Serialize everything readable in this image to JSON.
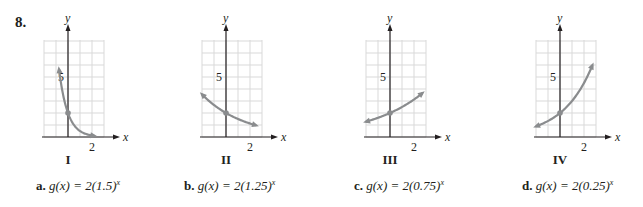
{
  "problem_number": "8.",
  "graphs": [
    {
      "label": "I",
      "base": 0.25,
      "origin_x": 68,
      "grid_left": 44,
      "grid_right": 104
    },
    {
      "label": "II",
      "base": 0.75,
      "origin_x": 226,
      "grid_left": 202,
      "grid_right": 262
    },
    {
      "label": "III",
      "base": 1.25,
      "origin_x": 390,
      "grid_left": 366,
      "grid_right": 426
    },
    {
      "label": "IV",
      "base": 1.5,
      "origin_x": 560,
      "grid_left": 536,
      "grid_right": 596
    }
  ],
  "axis": {
    "x_label": "x",
    "y_label": "y",
    "x_tick": "2",
    "y_tick": "5"
  },
  "options": [
    {
      "letter": "a.",
      "expr_prefix": "g(x) = 2(1.5)",
      "exp": "x"
    },
    {
      "letter": "b.",
      "expr_prefix": "g(x) = 2(1.25)",
      "exp": "x"
    },
    {
      "letter": "c.",
      "expr_prefix": "g(x) = 2(0.75)",
      "exp": "x"
    },
    {
      "letter": "d.",
      "expr_prefix": "g(x) = 2(0.25)",
      "exp": "x"
    }
  ],
  "chart_data": [
    {
      "type": "line",
      "title": "I",
      "function": "g(x)=2(0.25)^x",
      "x_range": [
        -0.75,
        2.2
      ],
      "point": [
        0,
        2
      ]
    },
    {
      "type": "line",
      "title": "II",
      "function": "g(x)=2(0.75)^x",
      "x_range": [
        -2,
        2.5
      ],
      "point": [
        0,
        2
      ]
    },
    {
      "type": "line",
      "title": "III",
      "function": "g(x)=2(1.25)^x",
      "x_range": [
        -2,
        2.7
      ],
      "point": [
        0,
        2
      ]
    },
    {
      "type": "line",
      "title": "IV",
      "function": "g(x)=2(1.5)^x",
      "x_range": [
        -2,
        2.7
      ],
      "point": [
        0,
        2
      ]
    }
  ],
  "colors": {
    "curve": "#8a8c8e",
    "grid": "#d9d9d9",
    "axis": "#231f20"
  }
}
